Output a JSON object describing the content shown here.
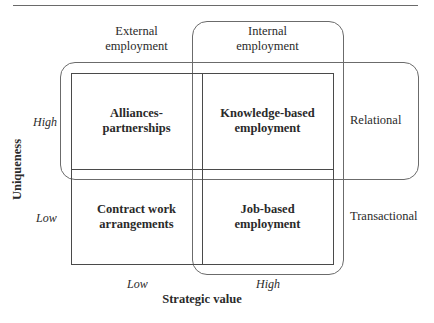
{
  "diagram": {
    "type": "2x2 matrix with overlapping groupings",
    "column_groups": {
      "external": [
        "External",
        "employment"
      ],
      "internal": [
        "Internal",
        "employment"
      ]
    },
    "row_groups": {
      "relational": "Relational",
      "transactional": "Transactional"
    },
    "cells": {
      "top_left": [
        "Alliances-",
        "partnerships"
      ],
      "top_right": [
        "Knowledge-based",
        "employment"
      ],
      "bottom_left": [
        "Contract work",
        "arrangements"
      ],
      "bottom_right": [
        "Job-based",
        "employment"
      ]
    },
    "y_axis": {
      "title": "Uniqueness",
      "high": "High",
      "low": "Low"
    },
    "x_axis": {
      "title": "Strategic value",
      "low": "Low",
      "high": "High"
    },
    "colors": {
      "matrix_line": "#4a4a4a",
      "group_outline": "#6b6b6b",
      "text": "#2a2a2a"
    }
  }
}
